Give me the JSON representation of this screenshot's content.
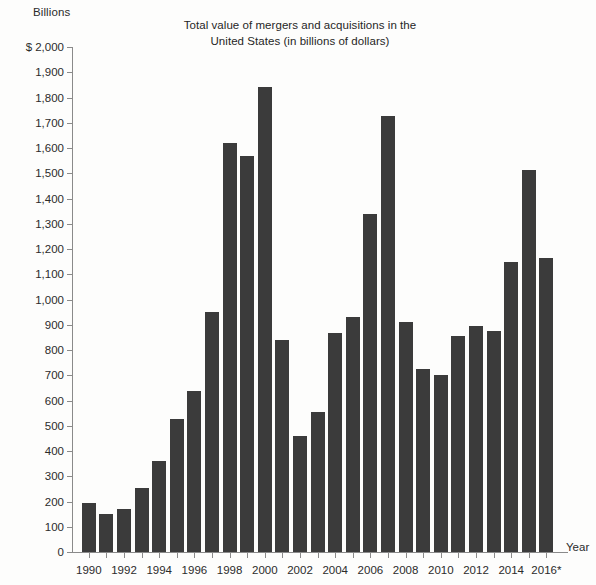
{
  "axis_unit_label": "Billions",
  "title_lines": [
    "Total value of mergers and acquisitions in the",
    "United States (in billions of dollars)"
  ],
  "x_axis_name": "Year",
  "colors": {
    "bar": "#3b3b3b",
    "axis": "#8a8a8a",
    "text": "#2b2b2b",
    "background": "#fdfdfc"
  },
  "chart_data": {
    "type": "bar",
    "title": "Total value of mergers and acquisitions in the United States (in billions of dollars)",
    "xlabel": "Year",
    "ylabel": "Billions",
    "ylim": [
      0,
      2000
    ],
    "ytick_step": 100,
    "grid": false,
    "legend": null,
    "y_currency_prefix": "$",
    "x_tick_labels_shown": [
      "1990",
      "1992",
      "1994",
      "1996",
      "1998",
      "2000",
      "2002",
      "2004",
      "2006",
      "2008",
      "2010",
      "2012",
      "2014",
      "2016*"
    ],
    "y_tick_labels": [
      "$ 2,000",
      "1,900",
      "1,800",
      "1,700",
      "1,600",
      "1,500",
      "1,400",
      "1,300",
      "1,200",
      "1,100",
      "1,000",
      "900",
      "800",
      "700",
      "600",
      "500",
      "400",
      "300",
      "200",
      "100",
      "0"
    ],
    "y_tick_values": [
      2000,
      1900,
      1800,
      1700,
      1600,
      1500,
      1400,
      1300,
      1200,
      1100,
      1000,
      900,
      800,
      700,
      600,
      500,
      400,
      300,
      200,
      100,
      0
    ],
    "footnote_marker": "*",
    "categories": [
      "1990",
      "1991",
      "1992",
      "1993",
      "1994",
      "1995",
      "1996",
      "1997",
      "1998",
      "1999",
      "2000",
      "2001",
      "2002",
      "2003",
      "2004",
      "2005",
      "2006",
      "2007",
      "2008",
      "2009",
      "2010",
      "2011",
      "2012",
      "2013",
      "2014",
      "2015",
      "2016*"
    ],
    "values": [
      195,
      152,
      170,
      252,
      360,
      528,
      638,
      950,
      1620,
      1570,
      1843,
      840,
      458,
      555,
      868,
      930,
      1340,
      1725,
      910,
      725,
      700,
      855,
      895,
      875,
      1150,
      1512,
      1165
    ],
    "points": [
      {
        "x": "1990",
        "y": 195
      },
      {
        "x": "1991",
        "y": 152
      },
      {
        "x": "1992",
        "y": 170
      },
      {
        "x": "1993",
        "y": 252
      },
      {
        "x": "1994",
        "y": 360
      },
      {
        "x": "1995",
        "y": 528
      },
      {
        "x": "1996",
        "y": 638
      },
      {
        "x": "1997",
        "y": 950
      },
      {
        "x": "1998",
        "y": 1620
      },
      {
        "x": "1999",
        "y": 1570
      },
      {
        "x": "2000",
        "y": 1843
      },
      {
        "x": "2001",
        "y": 840
      },
      {
        "x": "2002",
        "y": 458
      },
      {
        "x": "2003",
        "y": 555
      },
      {
        "x": "2004",
        "y": 868
      },
      {
        "x": "2005",
        "y": 930
      },
      {
        "x": "2006",
        "y": 1340
      },
      {
        "x": "2007",
        "y": 1725
      },
      {
        "x": "2008",
        "y": 910
      },
      {
        "x": "2009",
        "y": 725
      },
      {
        "x": "2010",
        "y": 700
      },
      {
        "x": "2011",
        "y": 855
      },
      {
        "x": "2012",
        "y": 895
      },
      {
        "x": "2013",
        "y": 875
      },
      {
        "x": "2014",
        "y": 1150
      },
      {
        "x": "2015",
        "y": 1512
      },
      {
        "x": "2016*",
        "y": 1165
      }
    ]
  }
}
